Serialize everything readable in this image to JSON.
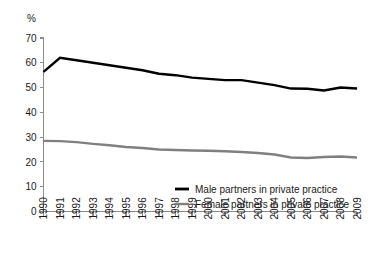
{
  "chart_data": {
    "type": "line",
    "title": "",
    "subtitle": "",
    "xlabel": "",
    "ylabel": "",
    "unit_label": "%",
    "grid": false,
    "legend_position": "inside-bottom-center",
    "xlim": [
      1990,
      2009
    ],
    "ylim": [
      0,
      70
    ],
    "y_ticks": [
      0,
      10,
      20,
      30,
      40,
      50,
      60,
      70
    ],
    "y_tick_labels": [
      "0",
      "10",
      "20",
      "30",
      "40",
      "50",
      "60",
      "70"
    ],
    "x": [
      1990,
      1991,
      1992,
      1993,
      1994,
      1995,
      1996,
      1997,
      1998,
      1999,
      2000,
      2001,
      2002,
      2003,
      2004,
      2005,
      2006,
      2007,
      2008,
      2009
    ],
    "categories": [
      "1990",
      "1991",
      "1992",
      "1993",
      "1994",
      "1995",
      "1996",
      "1997",
      "1998",
      "1999",
      "2000",
      "2001",
      "2002",
      "2003",
      "2004",
      "2005",
      "2006",
      "2007",
      "2008",
      "2009"
    ],
    "series": [
      {
        "name": "Male partners in private practice",
        "color": "#000000",
        "width": 2.4,
        "values": [
          56.3,
          62.0,
          61.0,
          60.0,
          59.0,
          58.0,
          57.0,
          55.6,
          55.0,
          54.0,
          53.5,
          53.0,
          53.0,
          52.0,
          51.0,
          49.6,
          49.5,
          48.8,
          50.0,
          49.6
        ]
      },
      {
        "name": "Female partners in private practice",
        "color": "#808080",
        "width": 2.4,
        "values": [
          28.5,
          28.4,
          28.0,
          27.3,
          26.7,
          26.0,
          25.6,
          25.0,
          24.8,
          24.6,
          24.5,
          24.3,
          24.0,
          23.6,
          23.0,
          21.8,
          21.6,
          22.0,
          22.2,
          21.8
        ]
      }
    ]
  },
  "legend": {
    "items": [
      {
        "label": "Male partners in private practice",
        "color": "#000000"
      },
      {
        "label": "Female partners in private practice",
        "color": "#808080"
      }
    ]
  },
  "colors": {
    "male_series": "#000000",
    "female_series": "#808080",
    "axis": "#8c8c8c",
    "text": "#1a1a1a",
    "background": "#ffffff"
  }
}
